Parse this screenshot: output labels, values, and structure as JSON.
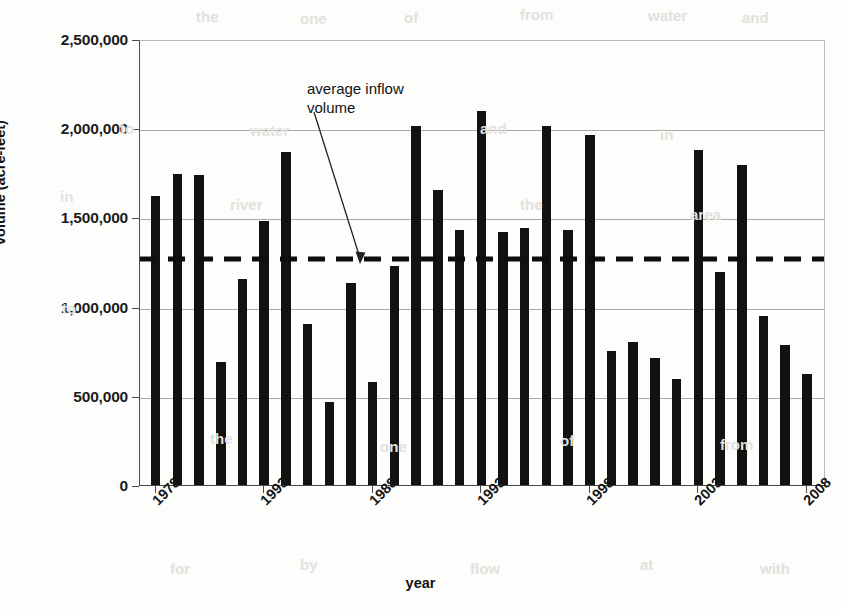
{
  "chart_data": {
    "type": "bar",
    "title": "",
    "xlabel": "year",
    "ylabel": "volume (acre-feet)",
    "ylim": [
      0,
      2500000
    ],
    "xlim_years": [
      1978,
      2008
    ],
    "grid": true,
    "legend_position": "none",
    "y_ticks": [
      {
        "value": 2500000,
        "label": "2,500,000"
      },
      {
        "value": 2000000,
        "label": "2,000,000"
      },
      {
        "value": 1500000,
        "label": "1,500,000"
      },
      {
        "value": 1000000,
        "label": "1,000,000"
      },
      {
        "value": 500000,
        "label": "500,000"
      },
      {
        "value": 0,
        "label": "0"
      }
    ],
    "x_tick_labels": [
      "1978",
      "1993",
      "1988",
      "1993",
      "1998",
      "2003",
      "2008"
    ],
    "x_tick_bar_index": [
      0,
      5,
      10,
      15,
      20,
      25,
      30
    ],
    "categories": [
      "1978",
      "1979",
      "1980",
      "1981",
      "1982",
      "1983",
      "1984",
      "1985",
      "1986",
      "1987",
      "1988",
      "1989",
      "1990",
      "1991",
      "1992",
      "1993",
      "1994",
      "1995",
      "1996",
      "1997",
      "1998",
      "1999",
      "2000",
      "2001",
      "2002",
      "2003",
      "2004",
      "2005",
      "2006",
      "2007",
      "2008"
    ],
    "values": [
      1620000,
      1745000,
      1735000,
      690000,
      1155000,
      1480000,
      1865000,
      900000,
      465000,
      1130000,
      580000,
      1225000,
      2010000,
      1655000,
      1430000,
      2095000,
      1420000,
      1440000,
      2010000,
      1430000,
      1960000,
      750000,
      800000,
      710000,
      595000,
      1880000,
      1195000,
      1795000,
      945000,
      785000,
      620000
    ],
    "annotations": [
      {
        "name": "average-inflow-volume",
        "text": "average inflow\nvolume",
        "line_value": 1280000,
        "line_style": "dashed",
        "line_color": "#0d0d0d"
      }
    ]
  },
  "axes": {
    "y_title": "volume (acre-feet)",
    "x_title": "year"
  },
  "ghost_text": {
    "items": [
      "the",
      "one",
      "of",
      "from",
      "water",
      "and",
      "in",
      "to",
      "river",
      "the",
      "area",
      "for",
      "by",
      "flow",
      "at",
      "with"
    ]
  }
}
